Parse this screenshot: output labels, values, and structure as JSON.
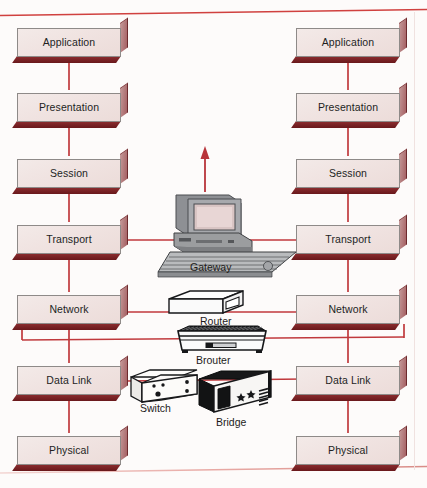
{
  "diagram": {
    "colors": {
      "link": "#c0393c",
      "rule_top": "#d0413f",
      "rule_bottom": "#e6a9a5",
      "box_fill": "#f0e3e1",
      "box_shadow": "#7d2b2e",
      "box_border": "#8e8a88",
      "page_bg": "#fdfbfa"
    },
    "rules": {
      "top_label": "page-rule-top",
      "bottom_label": "page-rule-bottom"
    },
    "left_stack": {
      "name": "left-osi-stack",
      "layers": [
        {
          "label": "Application"
        },
        {
          "label": "Presentation"
        },
        {
          "label": "Session"
        },
        {
          "label": "Transport"
        },
        {
          "label": "Network"
        },
        {
          "label": "Data Link"
        },
        {
          "label": "Physical"
        }
      ]
    },
    "right_stack": {
      "name": "right-osi-stack",
      "layers": [
        {
          "label": "Application"
        },
        {
          "label": "Presentation"
        },
        {
          "label": "Session"
        },
        {
          "label": "Transport"
        },
        {
          "label": "Network"
        },
        {
          "label": "Data Link"
        },
        {
          "label": "Physical"
        }
      ]
    },
    "devices": [
      {
        "label": "Gateway",
        "icon": "desktop-computer-icon",
        "layer": "Transport"
      },
      {
        "label": "Router",
        "icon": "router-box-icon",
        "layer": "Network"
      },
      {
        "label": "Brouter",
        "icon": "brouter-chassis-icon",
        "layer": "Network-DataLink"
      },
      {
        "label": "Switch",
        "icon": "switch-box-icon",
        "layer": "Data Link"
      },
      {
        "label": "Bridge",
        "icon": "bridge-chassis-icon",
        "layer": "Data Link"
      }
    ],
    "annotations": {
      "gateway_arrow": "upward-arrow-above-gateway"
    }
  }
}
